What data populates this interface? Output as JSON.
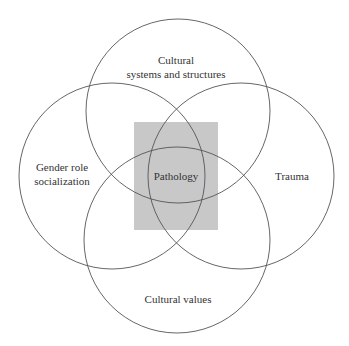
{
  "diagram": {
    "type": "venn",
    "center": {
      "label": "Pathology",
      "fill": "#c8c8c8"
    },
    "circles": [
      {
        "id": "top",
        "lines": [
          "Cultural",
          "systems and structures"
        ]
      },
      {
        "id": "left",
        "lines": [
          "Gender role",
          "socialization"
        ]
      },
      {
        "id": "right",
        "lines": [
          "Trauma"
        ]
      },
      {
        "id": "bottom",
        "lines": [
          "Cultural values"
        ]
      }
    ],
    "stroke_color": "#555555"
  }
}
